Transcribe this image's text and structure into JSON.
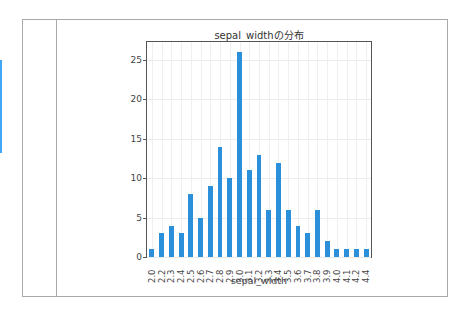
{
  "ui": {
    "selection_indicator_color": "#42a5f5"
  },
  "chart_data": {
    "type": "bar",
    "title": "sepal_widthの分布",
    "xlabel": "sepal_width",
    "ylabel": "",
    "categories": [
      "2.0",
      "2.2",
      "2.3",
      "2.4",
      "2.5",
      "2.6",
      "2.7",
      "2.8",
      "2.9",
      "3.0",
      "3.1",
      "3.2",
      "3.3",
      "3.4",
      "3.5",
      "3.6",
      "3.7",
      "3.8",
      "3.9",
      "4.0",
      "4.1",
      "4.2",
      "4.4"
    ],
    "values": [
      1,
      3,
      4,
      3,
      8,
      5,
      9,
      14,
      10,
      26,
      11,
      13,
      6,
      12,
      6,
      4,
      3,
      6,
      2,
      1,
      1,
      1,
      1
    ],
    "yticks": [
      0,
      5,
      10,
      15,
      20,
      25
    ],
    "ylim": [
      0,
      27.3
    ],
    "grid": true,
    "bar_color": "#2b90d9",
    "legend": null
  }
}
